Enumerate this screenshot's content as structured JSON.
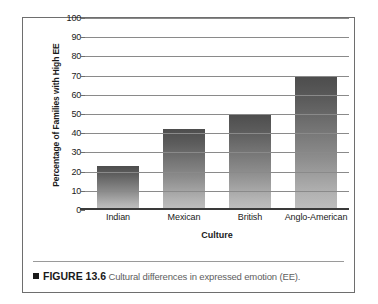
{
  "chart_data": {
    "type": "bar",
    "title": "",
    "xlabel": "Culture",
    "ylabel": "Percentage of Families with High EE",
    "categories": [
      "Indian",
      "Mexican",
      "British",
      "Anglo-American"
    ],
    "values": [
      22,
      41,
      49,
      68
    ],
    "ylim": [
      0,
      100
    ],
    "yticks": [
      0,
      10,
      20,
      30,
      40,
      50,
      60,
      70,
      80,
      90,
      100
    ],
    "ytick_labels": [
      "0",
      "10",
      "20",
      "30",
      "40",
      "50",
      "60",
      "70",
      "80",
      "90",
      "100"
    ],
    "grid": true,
    "legend": "none",
    "bar_color_top": "#4d4d4d",
    "bar_color_bottom": "#bdbdbd",
    "gridline_color": "#8a8a8a",
    "axis_color": "#3a3a3a"
  },
  "caption": {
    "marker": "black-square-icon",
    "figure_label": "FIGURE 13.6",
    "text": "Cultural differences in expressed emotion (EE)."
  }
}
